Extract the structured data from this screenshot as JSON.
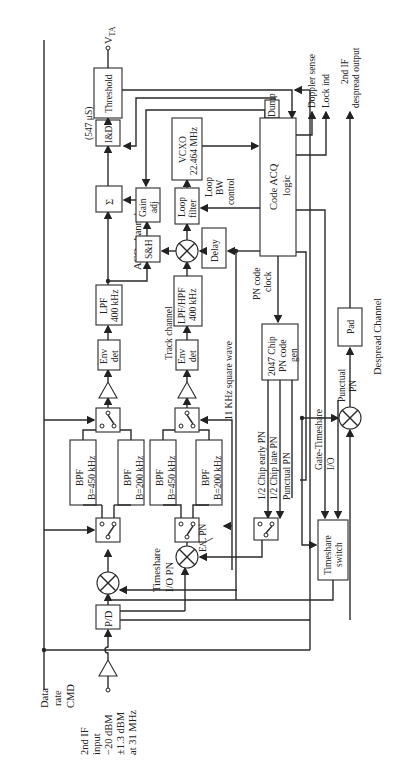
{
  "diagram": {
    "orientation": "rotated 90deg counter-clockwise",
    "colors": {
      "line": "#2a2a2a",
      "background": "#ffffff",
      "text": "#222222"
    },
    "inputs": {
      "data_rate_cmd": [
        "Data",
        "rate",
        "CMD"
      ],
      "if_input": [
        "2nd IF",
        "input",
        "−20 dBM",
        "±1.3 dBM",
        "at 31 MHz"
      ]
    },
    "blocks": {
      "pd": "P/D",
      "bpf_acq_450": [
        "BPF",
        "B=450 kHz"
      ],
      "bpf_acq_200": [
        "BPF",
        "B=200 kHz"
      ],
      "bpf_trk_450": [
        "BPF",
        "B=450 kHz"
      ],
      "bpf_trk_200": [
        "BPF",
        "B=200 kHz"
      ],
      "env_det_acq": [
        "Env",
        "det"
      ],
      "env_det_trk": [
        "Env",
        "det"
      ],
      "lpf_acq": [
        "LPF",
        "400 kHz"
      ],
      "lpf_hpf_trk": [
        "LPF/HPF",
        "400 kHz"
      ],
      "sum": "Σ",
      "sh": "S&H",
      "gain_adj": [
        "Gain",
        "adj"
      ],
      "loop_filter": [
        "Loop",
        "filter"
      ],
      "delay": "Delay",
      "vcxo": [
        "VCXO",
        "22.464 MHz"
      ],
      "ind": "I&D",
      "threshold": "Threshold",
      "dump": "Dump",
      "code_acq_logic": [
        "Code ACQ",
        "logic"
      ],
      "pn_code_gen": [
        "2047 Chip",
        "PN code",
        "gen"
      ],
      "timeshare_switch": [
        "Timeshare",
        "switch"
      ],
      "pad": "Pad"
    },
    "labels": {
      "acq_channel": "ACQ channel",
      "track_channel": "Track channel",
      "despread_channel": "Despread Channel",
      "ind_time": "(547 μS)",
      "vta": "V",
      "vta_sub": "TA",
      "timeshare_io_pn": [
        "Timeshare",
        "I/O PN"
      ],
      "el_pn": "E/L PN",
      "square_wave": "11 KHz square wave",
      "early_pn": "1/2 Chip early PN",
      "late_pn": "1/2 Chip late PN",
      "punctual_pn": "Punctual PN",
      "gate_timeshare": [
        "Gate-Timeshare",
        "I/O"
      ],
      "punctual_pn_despread": [
        "Punctual",
        "PN"
      ],
      "pn_code_clock": [
        "PN code",
        "clock"
      ],
      "loop_bw_control": [
        "Loop",
        "BW",
        "control"
      ],
      "doppler_sense": "Doppler sense",
      "lock_ind": "Lock ind",
      "despread_output": [
        "2nd IF",
        "despread output"
      ]
    }
  }
}
